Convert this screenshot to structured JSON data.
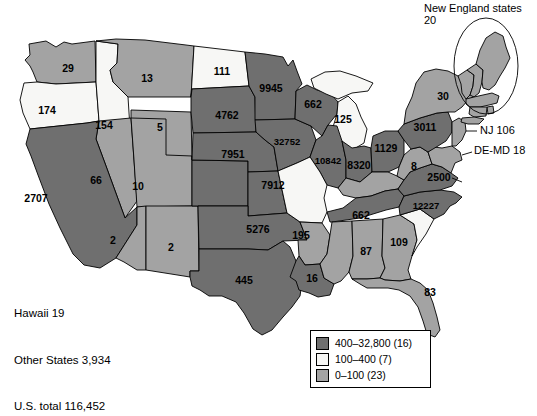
{
  "annotations": {
    "new_england": "New England states 20",
    "nj": "NJ 106",
    "demd": "DE-MD 18"
  },
  "corner_note": {
    "line1": "Hawaii 19",
    "line2": "Other States 3,934",
    "line3": "U.S. total 116,452"
  },
  "legend": {
    "items": [
      {
        "label": "400–32,800 (16)",
        "color": "#6f6f6f"
      },
      {
        "label": "100–400 (7)",
        "color": "#f7f7f5"
      },
      {
        "label": "0–100 (23)",
        "color": "#a3a3a3"
      }
    ]
  },
  "colors": {
    "high": "#6f6f6f",
    "mid": "#f7f7f5",
    "low": "#a3a3a3",
    "outline": "#000000",
    "background": "#ffffff"
  },
  "chart_data": {
    "type": "choropleth",
    "title": "",
    "unit": "count",
    "classes": [
      {
        "range": "400–32,800",
        "count": 16,
        "fill": "#6f6f6f"
      },
      {
        "range": "100–400",
        "count": 7,
        "fill": "#f7f7f5"
      },
      {
        "range": "0–100",
        "count": 23,
        "fill": "#a3a3a3"
      }
    ],
    "totals": {
      "hawaii": 19,
      "other_states": 3934,
      "us_total": 116452,
      "new_england_states": 20
    },
    "states": [
      {
        "id": "WA",
        "label": "29",
        "value": 29,
        "class": "low",
        "x": 68,
        "y": 69
      },
      {
        "id": "OR",
        "label": "174",
        "value": 174,
        "class": "mid",
        "x": 47,
        "y": 111
      },
      {
        "id": "ID",
        "label": "154",
        "value": 154,
        "class": "mid",
        "x": 104,
        "y": 126
      },
      {
        "id": "MT",
        "label": "13",
        "value": 13,
        "class": "low",
        "x": 147,
        "y": 79
      },
      {
        "id": "ND",
        "label": "111",
        "value": 111,
        "class": "mid",
        "x": 222,
        "y": 72
      },
      {
        "id": "SD",
        "label": "4762",
        "value": 4762,
        "class": "high",
        "x": 227,
        "y": 116
      },
      {
        "id": "MN",
        "label": "9945",
        "value": 9945,
        "class": "high",
        "x": 271,
        "y": 89
      },
      {
        "id": "WI",
        "label": "662",
        "value": 662,
        "class": "high",
        "x": 313,
        "y": 105
      },
      {
        "id": "MI",
        "label": "125",
        "value": 125,
        "class": "mid",
        "x": 343,
        "y": 120
      },
      {
        "id": "WY",
        "label": "5",
        "value": 5,
        "class": "low",
        "x": 160,
        "y": 128
      },
      {
        "id": "NE",
        "label": "7951",
        "value": 7951,
        "class": "high",
        "x": 233,
        "y": 155
      },
      {
        "id": "IA",
        "label": "32752",
        "value": 32752,
        "class": "high",
        "x": 287,
        "y": 142
      },
      {
        "id": "IL",
        "label": "10842",
        "value": 10842,
        "class": "high",
        "x": 328,
        "y": 161
      },
      {
        "id": "IN",
        "label": "8320",
        "value": 8320,
        "class": "high",
        "x": 359,
        "y": 166
      },
      {
        "id": "OH",
        "label": "1129",
        "value": 1129,
        "class": "high",
        "x": 386,
        "y": 149
      },
      {
        "id": "PA",
        "label": "3011",
        "value": 3011,
        "class": "high",
        "x": 425,
        "y": 128
      },
      {
        "id": "NY",
        "label": "30",
        "value": 30,
        "class": "low",
        "x": 443,
        "y": 97
      },
      {
        "id": "NV",
        "label": "66",
        "value": 66,
        "class": "low",
        "x": 96,
        "y": 181
      },
      {
        "id": "UT",
        "label": "10",
        "value": 10,
        "class": "low",
        "x": 138,
        "y": 187
      },
      {
        "id": "CO",
        "label": "7912",
        "value": 7912,
        "class": "high",
        "x": 273,
        "y": 186
      },
      {
        "id": "CA",
        "label": "2707",
        "value": 2707,
        "class": "high",
        "x": 36,
        "y": 199
      },
      {
        "id": "AZ",
        "label": "2",
        "value": 2,
        "class": "low",
        "x": 113,
        "y": 241
      },
      {
        "id": "NM",
        "label": "2",
        "value": 2,
        "class": "low",
        "x": 171,
        "y": 248
      },
      {
        "id": "KS",
        "label": "5276",
        "value": 5276,
        "class": "high",
        "x": 258,
        "y": 230
      },
      {
        "id": "MO",
        "label": "195",
        "value": 195,
        "class": "mid",
        "x": 301,
        "y": 236
      },
      {
        "id": "KY",
        "label": "8",
        "value": 8,
        "class": "low",
        "x": 414,
        "y": 167
      },
      {
        "id": "TN",
        "label": "662",
        "value": 662,
        "class": "high",
        "x": 361,
        "y": 216
      },
      {
        "id": "VA",
        "label": "2500",
        "value": 2500,
        "class": "high",
        "x": 439,
        "y": 178
      },
      {
        "id": "NC",
        "label": "12227",
        "value": 12227,
        "class": "high",
        "x": 426,
        "y": 206
      },
      {
        "id": "SC",
        "label": "109",
        "value": 109,
        "class": "mid",
        "x": 399,
        "y": 243
      },
      {
        "id": "GA",
        "label": "87",
        "value": 87,
        "class": "low",
        "x": 366,
        "y": 252
      },
      {
        "id": "AR",
        "label": "16",
        "value": 16,
        "class": "low",
        "x": 312,
        "y": 279
      },
      {
        "id": "TX",
        "label": "445",
        "value": 445,
        "class": "high",
        "x": 244,
        "y": 281
      },
      {
        "id": "FL",
        "label": "83",
        "value": 83,
        "class": "low",
        "x": 430,
        "y": 293
      }
    ]
  }
}
